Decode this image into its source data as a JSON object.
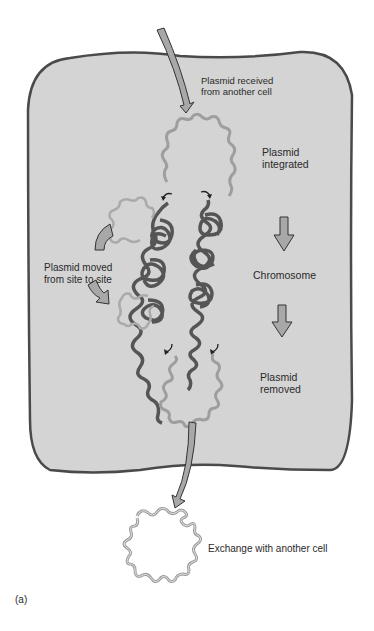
{
  "diagram": {
    "type": "plasmid-lifecycle",
    "panel_label": "(a)",
    "labels": {
      "received": [
        "Plasmid received",
        "from another cell"
      ],
      "integrated": [
        "Plasmid",
        "integrated"
      ],
      "moved": [
        "Plasmid moved",
        "from site to site"
      ],
      "chromosome": "Chromosome",
      "removed": [
        "Plasmid",
        "removed"
      ],
      "exchange": "Exchange with another cell"
    },
    "colors": {
      "cell_fill": "#d4d4d4",
      "cell_border": "#4a4a4a",
      "plasmid": "#9e9e9e",
      "chromosome": "#555555",
      "arrow_fill": "#a8a8a8",
      "arrow_stroke": "#333333",
      "text": "#2a2a2a"
    }
  }
}
